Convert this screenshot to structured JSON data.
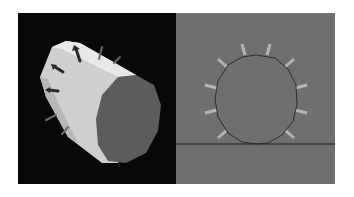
{
  "figure": {
    "panels": [
      {
        "id": "left",
        "description": "3D rendered polygonal cylinder with normal arrows",
        "background": "#080808",
        "body_color": "#d8d8d8",
        "cap_color": "#5a5a5a",
        "arrow_color": "#2a2a2a"
      },
      {
        "id": "right",
        "description": "Cross-section polygon with normal vectors resting on ground line",
        "background": "#6f6f6f",
        "outline_color": "#1a1a1a",
        "normal_color": "#b0b0b0",
        "ground_line_color": "#1a1a1a"
      }
    ],
    "polygon_sides": 14
  }
}
